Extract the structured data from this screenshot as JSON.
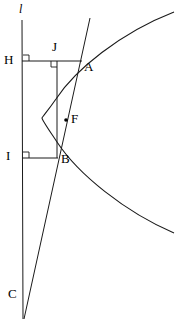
{
  "figure": {
    "width": 189,
    "height": 319,
    "background_color": "#ffffff",
    "stroke_color": "#1a1a1a"
  },
  "labels": {
    "directrix": {
      "text": "l",
      "x": 19,
      "y": 3,
      "italic": true
    },
    "H": {
      "text": "H",
      "x": 4,
      "y": 53
    },
    "J": {
      "text": "J",
      "x": 52,
      "y": 40
    },
    "A": {
      "text": "A",
      "x": 84,
      "y": 60
    },
    "F": {
      "text": "F",
      "x": 71,
      "y": 112
    },
    "B": {
      "text": "B",
      "x": 61,
      "y": 152
    },
    "I": {
      "text": "I",
      "x": 6,
      "y": 149
    },
    "C": {
      "text": "C",
      "x": 8,
      "y": 287
    }
  },
  "points": {
    "H": {
      "x": 22,
      "y": 61
    },
    "J": {
      "x": 57,
      "y": 61
    },
    "A": {
      "x": 81,
      "y": 61
    },
    "F": {
      "x": 66,
      "y": 120
    },
    "B": {
      "x": 57,
      "y": 158
    },
    "I": {
      "x": 22,
      "y": 158
    },
    "C": {
      "x": 23,
      "y": 300
    }
  },
  "segments": {
    "directrix_line": {
      "x1": 22,
      "y1": 20,
      "x2": 23,
      "y2": 319
    },
    "secant_line": {
      "x1": 90,
      "y1": 18,
      "x2": 24,
      "y2": 319
    },
    "HA_segment": {
      "x1": 22,
      "y1": 61,
      "x2": 82,
      "y2": 61
    },
    "IB_segment": {
      "x1": 22,
      "y1": 158,
      "x2": 58,
      "y2": 158
    },
    "JB_segment": {
      "x1": 57,
      "y1": 61,
      "x2": 57,
      "y2": 158
    }
  },
  "right_angles": {
    "at_H": {
      "x": 23,
      "y": 55,
      "size": 6
    },
    "at_J": {
      "x": 51,
      "y": 61,
      "size": 6
    },
    "at_I": {
      "x": 23,
      "y": 152,
      "size": 6
    }
  },
  "curve": {
    "type": "parabola",
    "vertex": {
      "x": 42,
      "y": 118
    },
    "opens": "right",
    "upper_end": {
      "x": 174,
      "y": 12
    },
    "lower_end": {
      "x": 174,
      "y": 233
    },
    "path": "M 174 12 C 120 33 75 70 56 99 C 47 112 42 117 42 118 C 42 120 47 127 57 142 C 78 174 125 212 174 233"
  },
  "focus_dot": {
    "cx": 66,
    "cy": 120,
    "r": 1.8
  }
}
